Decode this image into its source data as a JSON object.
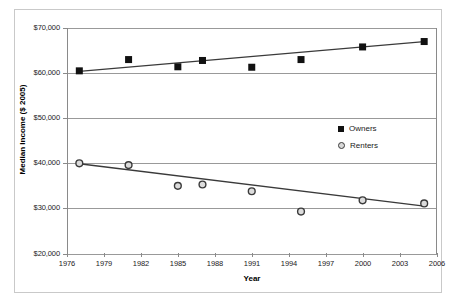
{
  "chart_data": {
    "type": "scatter",
    "title": "",
    "xlabel": "Year",
    "ylabel": "Median Income ($ 2005)",
    "xlim": [
      1976,
      2006
    ],
    "ylim": [
      20000,
      70000
    ],
    "grid": true,
    "legend_position": "center-right",
    "xticks": [
      "1976",
      "1979",
      "1982",
      "1985",
      "1988",
      "1991",
      "1994",
      "1997",
      "2000",
      "2003",
      "2006"
    ],
    "xtick_values": [
      1976,
      1979,
      1982,
      1985,
      1988,
      1991,
      1994,
      1997,
      2000,
      2003,
      2006
    ],
    "yticks": [
      "$20,000",
      "$30,000",
      "$40,000",
      "$50,000",
      "$60,000",
      "$70,000"
    ],
    "ytick_values": [
      20000,
      30000,
      40000,
      50000,
      60000,
      70000
    ],
    "series": [
      {
        "name": "Owners",
        "marker": "filled-square",
        "color": "#111111",
        "x": [
          1977,
          1981,
          1985,
          1987,
          1991,
          1995,
          2000,
          2005
        ],
        "values": [
          60500,
          63000,
          61400,
          62800,
          61300,
          63000,
          65800,
          67000
        ],
        "trendline": {
          "x": [
            1977,
            2005
          ],
          "y": [
            60400,
            67000
          ]
        }
      },
      {
        "name": "Renters",
        "marker": "open-circle",
        "color": "#3a3a3a",
        "x": [
          1977,
          1981,
          1985,
          1987,
          1991,
          1995,
          2000,
          2005
        ],
        "values": [
          40000,
          39600,
          35000,
          35300,
          33800,
          29300,
          31800,
          31100
        ],
        "trendline": {
          "x": [
            1977,
            2005
          ],
          "y": [
            39900,
            30500
          ]
        }
      }
    ]
  },
  "legend": {
    "items": [
      {
        "label": "Owners",
        "marker": "filled-square"
      },
      {
        "label": "Renters",
        "marker": "open-circle"
      }
    ]
  },
  "axes": {
    "x_title": "Year",
    "y_title": "Median Income ($ 2005)"
  }
}
